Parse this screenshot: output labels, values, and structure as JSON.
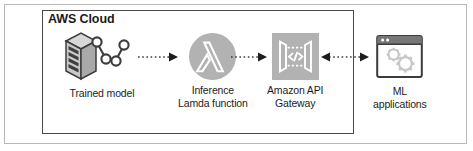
{
  "diagram": {
    "cloud_boundary": {
      "label": "AWS Cloud"
    },
    "nodes": [
      {
        "id": "trained-model",
        "label": "Trained model",
        "icon": "server-with-node-chain-icon"
      },
      {
        "id": "inference-lambda-function",
        "label": "Inference\nLamda function",
        "icon": "aws-lambda-icon"
      },
      {
        "id": "amazon-api-gateway",
        "label": "Amazon API\nGateway",
        "icon": "amazon-api-gateway-icon"
      },
      {
        "id": "ml-applications",
        "label": "ML\napplications",
        "icon": "browser-window-gears-icon"
      }
    ],
    "connectors": [
      {
        "id": "model-to-lambda",
        "from": "trained-model",
        "to": "inference-lambda-function",
        "style": "dotted",
        "direction": "forward"
      },
      {
        "id": "lambda-to-apigw",
        "from": "inference-lambda-function",
        "to": "amazon-api-gateway",
        "style": "dotted",
        "direction": "forward"
      },
      {
        "id": "apigw-to-mlapps",
        "from": "amazon-api-gateway",
        "to": "ml-applications",
        "style": "dotted",
        "direction": "bidirectional"
      }
    ],
    "colors": {
      "icon_fill": "#b2b2b2",
      "icon_glyph": "#ffffff",
      "boundary_stroke": "#4a4a4a",
      "frame_stroke": "#b9b9b9",
      "text": "#1d1d1d",
      "connector": "#3c3c3c"
    }
  }
}
